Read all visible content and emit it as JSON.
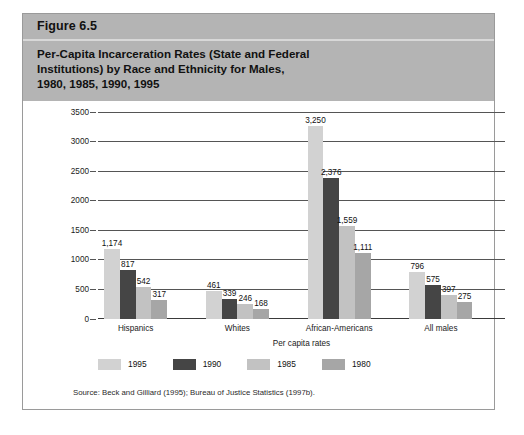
{
  "figure": {
    "number_label": "Figure 6.5",
    "title_lines": [
      "Per-Capita Incarceration Rates (State and Federal",
      "Institutions) by Race and Ethnicity for Males,",
      "1980, 1985, 1990, 1995"
    ],
    "source_note": "Source: Beck and Gilliard (1995); Bureau of Justice Statistics (1997b)."
  },
  "chart_data": {
    "type": "bar",
    "title": "Per-Capita Incarceration Rates (State and Federal Institutions) by Race and Ethnicity for Males, 1980, 1985, 1990, 1995",
    "xlabel": "Per capita rates",
    "ylabel": "",
    "ylim": [
      0,
      3500
    ],
    "yticks": [
      0,
      500,
      1000,
      1500,
      2000,
      2500,
      3000,
      3500
    ],
    "ytick_labels": [
      "0",
      "500",
      "1000",
      "1500",
      "2000",
      "2500",
      "3000",
      "3500"
    ],
    "grid": true,
    "legend_position": "below",
    "categories": [
      "Hispanics",
      "Whites",
      "African-Americans",
      "All males"
    ],
    "series": [
      {
        "name": "1995",
        "color": "#d2d2d2",
        "values": [
          1174,
          461,
          3250,
          796
        ],
        "labels": [
          "1,174",
          "461",
          "3,250",
          "796"
        ]
      },
      {
        "name": "1990",
        "color": "#454545",
        "values": [
          817,
          339,
          2376,
          575
        ],
        "labels": [
          "817",
          "339",
          "2,376",
          "575"
        ]
      },
      {
        "name": "1985",
        "color": "#c2c2c2",
        "values": [
          542,
          246,
          1559,
          397
        ],
        "labels": [
          "542",
          "246",
          "1,559",
          "397"
        ]
      },
      {
        "name": "1980",
        "color": "#a6a6a6",
        "values": [
          317,
          168,
          1111,
          275
        ],
        "labels": [
          "317",
          "168",
          "1,111",
          "275"
        ]
      }
    ]
  }
}
